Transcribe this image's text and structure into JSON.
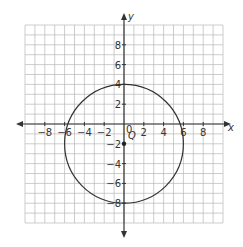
{
  "chart_data": {
    "type": "scatter",
    "title": "",
    "xlabel": "x",
    "ylabel": "y",
    "xlim": [
      -10,
      10
    ],
    "ylim": [
      -10,
      10
    ],
    "grid": true,
    "x_ticks": [
      "-8",
      "-6",
      "-4",
      "-2",
      "0",
      "2",
      "4",
      "6",
      "8"
    ],
    "y_ticks": [
      "8",
      "6",
      "4",
      "2",
      "-2",
      "-4",
      "-6",
      "-8"
    ],
    "shapes": [
      {
        "type": "circle",
        "center": [
          0,
          -2
        ],
        "radius": 6
      }
    ],
    "points": [
      {
        "label": "Q",
        "x": 0,
        "y": -2
      }
    ]
  },
  "labels": {
    "x_axis": "x",
    "y_axis": "y",
    "origin": "0",
    "point": "Q"
  },
  "colors": {
    "grid": "#b8b8b8",
    "axis": "#333333",
    "curve": "#333333"
  }
}
